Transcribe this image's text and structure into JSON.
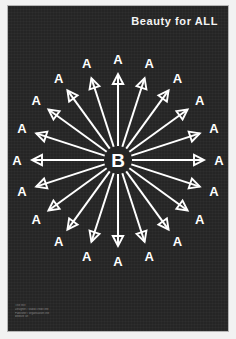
{
  "poster": {
    "title": "Beauty for ALL",
    "background_color": "#252525",
    "ink_color": "#ffffff",
    "center_label": "B",
    "ray_label": "A",
    "ray_count": 20,
    "ray_angle_step_degrees": 18,
    "credits": [
      "Title text",
      "Designer / studio credit line",
      "Publisher / organisation line",
      "website url"
    ]
  },
  "chart_data": {
    "type": "scatter",
    "title": "Beauty for ALL",
    "xlabel": "",
    "ylabel": "",
    "center": {
      "label": "B",
      "x": 0,
      "y": 0
    },
    "legend_position": "none",
    "grid": false,
    "series": [
      {
        "name": "radiating-arrows",
        "label": "A",
        "count": 20,
        "angles_degrees": [
          0,
          18,
          36,
          54,
          72,
          90,
          108,
          126,
          144,
          162,
          180,
          198,
          216,
          234,
          252,
          270,
          288,
          306,
          324,
          342
        ],
        "values": [
          1,
          1,
          1,
          1,
          1,
          1,
          1,
          1,
          1,
          1,
          1,
          1,
          1,
          1,
          1,
          1,
          1,
          1,
          1,
          1
        ]
      }
    ]
  }
}
